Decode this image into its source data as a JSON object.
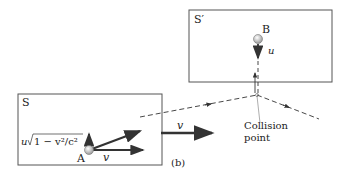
{
  "diagram": {
    "panel_label": "(b)",
    "frame_s": {
      "label": "S"
    },
    "frame_s_prime": {
      "label": "S′"
    },
    "particle_a": {
      "label": "A"
    },
    "particle_b": {
      "label": "B"
    },
    "velocity_labels": {
      "a_horizontal": "v",
      "a_vertical_prefix": "u",
      "a_vertical_sqrt": "1 − v²/c²",
      "frame_velocity": "v",
      "b_vertical": "u"
    },
    "annotation": {
      "line1": "Collision",
      "line2": "point"
    },
    "colors": {
      "line": "#333333",
      "frame": "#555555",
      "ball": "#cccccc"
    }
  }
}
